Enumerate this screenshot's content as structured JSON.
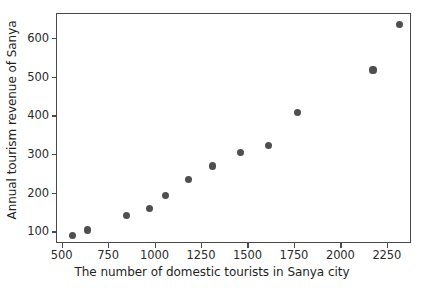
{
  "chart_data": {
    "type": "scatter",
    "title": "",
    "xlabel": "The number of domestic tourists in Sanya city",
    "ylabel": "Annual tourism revenue of Sanya",
    "xlim": [
      470,
      2380
    ],
    "ylim": [
      70,
      665
    ],
    "grid": false,
    "legend": null,
    "marker_color": "#4f4f52",
    "xticks": [
      500,
      750,
      1000,
      1250,
      1500,
      1750,
      2000,
      2250
    ],
    "xtick_labels": [
      "500",
      "750",
      "1000",
      "1250",
      "1500",
      "1750",
      "2000",
      "2250"
    ],
    "yticks": [
      100,
      200,
      300,
      400,
      500,
      600
    ],
    "ytick_labels": [
      "100",
      "200",
      "300",
      "400",
      "500",
      "600"
    ],
    "series": [
      {
        "name": "Sanya tourism",
        "x": [
          552,
          636,
          843,
          966,
          1052,
          1178,
          1308,
          1459,
          1609,
          1764,
          2170,
          2311
        ],
        "y": [
          92,
          106,
          143,
          161,
          195,
          236,
          272,
          306,
          325,
          410,
          520,
          638
        ]
      }
    ],
    "points": [
      {
        "x": 552,
        "y": 92
      },
      {
        "x": 636,
        "y": 106
      },
      {
        "x": 843,
        "y": 143
      },
      {
        "x": 966,
        "y": 161
      },
      {
        "x": 1052,
        "y": 195
      },
      {
        "x": 1178,
        "y": 236
      },
      {
        "x": 1308,
        "y": 272
      },
      {
        "x": 1459,
        "y": 306
      },
      {
        "x": 1609,
        "y": 325
      },
      {
        "x": 1764,
        "y": 410
      },
      {
        "x": 2170,
        "y": 520
      },
      {
        "x": 2311,
        "y": 638
      }
    ]
  }
}
